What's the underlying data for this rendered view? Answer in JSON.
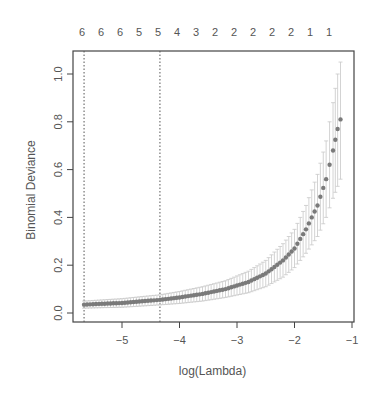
{
  "chart_data": {
    "type": "scatter",
    "subtype": "cv.glmnet error-bar plot",
    "title": "",
    "xlabel": "log(Lambda)",
    "ylabel": "Binomial Deviance",
    "xlim": [
      -5.85,
      -1.0
    ],
    "ylim": [
      0.0,
      1.05
    ],
    "x_ticks": [
      -5,
      -4,
      -3,
      -2,
      -1
    ],
    "x_tick_labels": [
      "−5",
      "−4",
      "−3",
      "−2",
      "−1"
    ],
    "y_ticks": [
      0.0,
      0.2,
      0.4,
      0.6,
      0.8,
      1.0
    ],
    "y_tick_labels": [
      "0.0",
      "0.2",
      "0.4",
      "0.6",
      "0.8",
      "1.0"
    ],
    "top_axis_labels": [
      "6",
      "6",
      "6",
      "5",
      "5",
      "4",
      "3",
      "2",
      "2",
      "2",
      "2",
      "2",
      "1",
      "1"
    ],
    "vlines": [
      {
        "name": "lambda.min",
        "x": -5.66,
        "style": "dotted"
      },
      {
        "name": "lambda.1se",
        "x": -4.34,
        "style": "dotted"
      }
    ],
    "grid": false,
    "legend": null,
    "series": [
      {
        "name": "mean cross-validated deviance",
        "marker": "filled circle",
        "color": "#7a7a7a",
        "errorbar_color": "#c8c8c8",
        "points": [
          {
            "x": -5.66,
            "y": 0.035,
            "lo": 0.02,
            "hi": 0.05
          },
          {
            "x": -5.4,
            "y": 0.038,
            "lo": 0.022,
            "hi": 0.054
          },
          {
            "x": -5.0,
            "y": 0.042,
            "lo": 0.024,
            "hi": 0.06
          },
          {
            "x": -4.6,
            "y": 0.05,
            "lo": 0.03,
            "hi": 0.07
          },
          {
            "x": -4.34,
            "y": 0.055,
            "lo": 0.034,
            "hi": 0.076
          },
          {
            "x": -4.0,
            "y": 0.065,
            "lo": 0.04,
            "hi": 0.09
          },
          {
            "x": -3.6,
            "y": 0.08,
            "lo": 0.05,
            "hi": 0.11
          },
          {
            "x": -3.2,
            "y": 0.1,
            "lo": 0.065,
            "hi": 0.135
          },
          {
            "x": -2.8,
            "y": 0.13,
            "lo": 0.085,
            "hi": 0.175
          },
          {
            "x": -2.5,
            "y": 0.165,
            "lo": 0.11,
            "hi": 0.22
          },
          {
            "x": -2.2,
            "y": 0.22,
            "lo": 0.15,
            "hi": 0.29
          },
          {
            "x": -2.0,
            "y": 0.27,
            "lo": 0.19,
            "hi": 0.35
          },
          {
            "x": -1.8,
            "y": 0.35,
            "lo": 0.25,
            "hi": 0.45
          },
          {
            "x": -1.6,
            "y": 0.45,
            "lo": 0.32,
            "hi": 0.58
          },
          {
            "x": -1.45,
            "y": 0.56,
            "lo": 0.4,
            "hi": 0.72
          },
          {
            "x": -1.33,
            "y": 0.68,
            "lo": 0.48,
            "hi": 0.88
          },
          {
            "x": -1.25,
            "y": 0.77,
            "lo": 0.53,
            "hi": 1.0
          },
          {
            "x": -1.2,
            "y": 0.81,
            "lo": 0.56,
            "hi": 1.05
          }
        ]
      }
    ]
  },
  "layout": {
    "plot_left": 73,
    "plot_right": 354,
    "plot_top": 51,
    "plot_bottom": 322,
    "x_px_per_unit": 57.5,
    "x_origin_value": -5,
    "x_origin_px": 122,
    "y_px_per_unit": 239,
    "y_origin_value": 0.0,
    "y_origin_px": 313,
    "top_label_start_px": 82,
    "top_label_step_px": 19
  }
}
